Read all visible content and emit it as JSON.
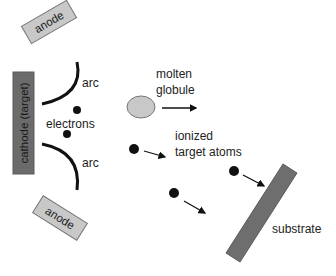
{
  "diagram": {
    "title": "",
    "colors": {
      "anode_fill": "#c8c8c8",
      "cathode_fill": "#6b6b6b",
      "substrate_fill": "#6e6e6e",
      "globule_fill": "#c8c8c8",
      "particle": "#111111",
      "arc_stroke": "#111111"
    },
    "components": {
      "anode_top": "anode",
      "cathode": "cathode (target)",
      "anode_bottom": "anode",
      "substrate": "substrate"
    },
    "labels": {
      "arc_top": "arc",
      "arc_bottom": "arc",
      "electrons": "electrons",
      "molten_line1": "molten",
      "molten_line2": "globule",
      "ionized_line1": "ionized",
      "ionized_line2": "target atoms"
    }
  }
}
